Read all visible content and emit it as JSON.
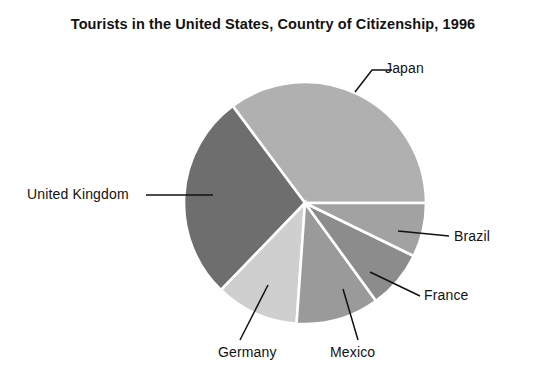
{
  "chart_data": {
    "type": "pie",
    "title": "Tourists in the United States, Country of Citizenship, 1996",
    "xlabel": "",
    "ylabel": "",
    "legend_position": "none",
    "grid": false,
    "labels_placement": "outside-with-leader-lines",
    "categories": [
      "Japan",
      "United Kingdom",
      "Germany",
      "Mexico",
      "France",
      "Brazil"
    ],
    "values": [
      35.2,
      27.6,
      11.1,
      11.1,
      7.8,
      7.2
    ],
    "value_unit": "percent of total",
    "start_angle_deg": 0,
    "direction": "counterclockwise",
    "slices": [
      {
        "label": "Japan",
        "value": 35.2,
        "start_deg": 0,
        "end_deg": 126.7,
        "color": "#b0b0b0"
      },
      {
        "label": "United Kingdom",
        "value": 27.6,
        "start_deg": 126.7,
        "end_deg": 226.0,
        "color": "#6e6e6e"
      },
      {
        "label": "Germany",
        "value": 11.1,
        "start_deg": 226.0,
        "end_deg": 266.0,
        "color": "#cfcfcf"
      },
      {
        "label": "Mexico",
        "value": 11.1,
        "start_deg": 266.0,
        "end_deg": 306.0,
        "color": "#9a9a9a"
      },
      {
        "label": "France",
        "value": 7.8,
        "start_deg": 306.0,
        "end_deg": 334.0,
        "color": "#8c8c8c"
      },
      {
        "label": "Brazil",
        "value": 7.2,
        "start_deg": 334.0,
        "end_deg": 360.0,
        "color": "#a2a2a2"
      }
    ],
    "geometry": {
      "center_x": 305,
      "center_y": 203,
      "radius": 121
    },
    "colors": {
      "background": "#ffffff",
      "text": "#121212",
      "slice_border": "#ffffff",
      "leader_line": "#121212"
    }
  },
  "labels": {
    "japan": "Japan",
    "united_kingdom": "United Kingdom",
    "germany": "Germany",
    "mexico": "Mexico",
    "france": "France",
    "brazil": "Brazil"
  }
}
